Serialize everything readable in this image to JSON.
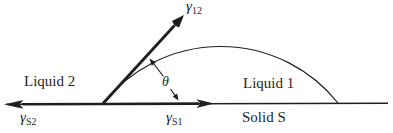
{
  "diagram": {
    "regions": {
      "liquid_2": "Liquid 2",
      "liquid_1": "Liquid 1",
      "solid": "Solid S"
    },
    "angle": {
      "symbol": "θ"
    },
    "tensions": {
      "gamma_12": {
        "symbol": "γ",
        "subscript": "12"
      },
      "gamma_s2": {
        "symbol": "γ",
        "subscript": "S2"
      },
      "gamma_s1": {
        "symbol": "γ",
        "subscript": "S1"
      }
    },
    "colors": {
      "ink": "#1f1f1f",
      "background": "#ffffff"
    }
  }
}
